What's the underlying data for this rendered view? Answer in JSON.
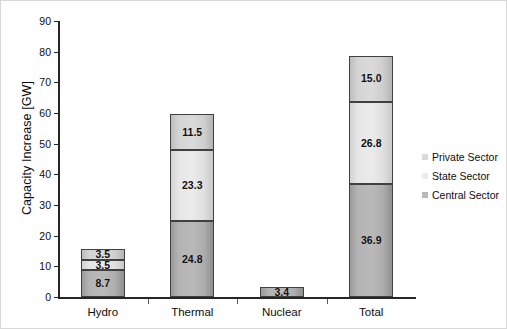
{
  "chart_data": {
    "type": "bar",
    "stacked": true,
    "title": "",
    "xlabel": "",
    "ylabel": "Capacity Increase [GW]",
    "ylim": [
      0,
      90
    ],
    "yticks": [
      0,
      10,
      20,
      30,
      40,
      50,
      60,
      70,
      80,
      90
    ],
    "ytick_labels": [
      "0",
      "10",
      "20",
      "30",
      "40",
      "50",
      "60",
      "70",
      "80",
      "90"
    ],
    "grid": false,
    "legend_position": "right",
    "categories": [
      "Hydro",
      "Thermal",
      "Nuclear",
      "Total"
    ],
    "series": [
      {
        "name": "Central Sector",
        "color": "#b9b9b9",
        "values": [
          8.7,
          24.8,
          3.4,
          36.9
        ],
        "labels": [
          "8.7",
          "24.8",
          "3.4",
          "36.9"
        ]
      },
      {
        "name": "State Sector",
        "color": "#ebebeb",
        "values": [
          3.5,
          23.3,
          0,
          26.8
        ],
        "labels": [
          "3.5",
          "23.3",
          "",
          "26.8"
        ]
      },
      {
        "name": "Private Sector",
        "color": "#dadada",
        "values": [
          3.5,
          11.5,
          0,
          15.0
        ],
        "labels": [
          "3.5",
          "11.5",
          "",
          "15.0"
        ]
      }
    ],
    "totals": [
      15.7,
      59.6,
      3.4,
      78.7
    ]
  },
  "legend": {
    "items": [
      {
        "label": "Private Sector",
        "color": "#dadada"
      },
      {
        "label": "State Sector",
        "color": "#ebebeb"
      },
      {
        "label": "Central Sector",
        "color": "#b9b9b9"
      }
    ]
  },
  "axes": {
    "y_title": "Capacity Increase [GW]",
    "y_labels": [
      "90",
      "80",
      "70",
      "60",
      "50",
      "40",
      "30",
      "20",
      "10",
      "0"
    ],
    "x_labels": [
      "Hydro",
      "Thermal",
      "Nuclear",
      "Total"
    ]
  }
}
